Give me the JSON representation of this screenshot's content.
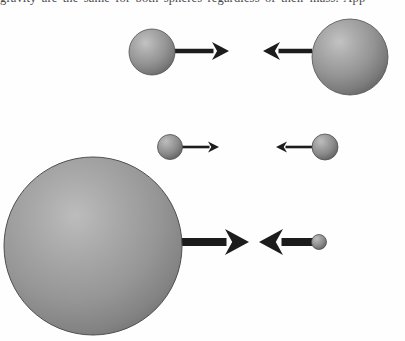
{
  "figure": {
    "caption_fragment_top": "gravity are the same for both spheres regardless of their mass. App",
    "background_color": "#fefefe",
    "sphere_fill_light": "#b4b4b4",
    "sphere_fill_mid": "#8d8d8d",
    "sphere_fill_dark": "#5f5f5f",
    "sphere_edge_color": "#4f4f4f",
    "arrow_color": "#1c1c1c",
    "width": 405,
    "height": 341
  },
  "rows": [
    {
      "name": "row-1",
      "label": "top pair: medium sphere and large sphere",
      "spheres": [
        {
          "name": "row1-left-sphere",
          "cx": 152,
          "cy": 52,
          "r": 23,
          "size_label": "medium"
        },
        {
          "name": "row1-right-sphere",
          "cx": 350,
          "cy": 57,
          "r": 38,
          "size_label": "large"
        }
      ],
      "arrows": [
        {
          "name": "row1-right-arrow",
          "direction": "right",
          "x_start": 175,
          "x_end": 229,
          "y": 51,
          "shaft_width": 4.5,
          "head_length": 17,
          "head_half_height": 9
        },
        {
          "name": "row1-left-arrow",
          "direction": "left",
          "x_start": 312,
          "x_end": 263,
          "y": 51,
          "shaft_width": 4.5,
          "head_length": 17,
          "head_half_height": 9
        }
      ]
    },
    {
      "name": "row-2",
      "label": "middle pair: two small equal spheres",
      "spheres": [
        {
          "name": "row2-left-sphere",
          "cx": 170,
          "cy": 147,
          "r": 12.5,
          "size_label": "small"
        },
        {
          "name": "row2-right-sphere",
          "cx": 325,
          "cy": 147,
          "r": 13,
          "size_label": "small"
        }
      ],
      "arrows": [
        {
          "name": "row2-right-arrow",
          "direction": "right",
          "x_start": 181,
          "x_end": 219,
          "y": 147,
          "shaft_width": 2.6,
          "head_length": 11,
          "head_half_height": 5.5
        },
        {
          "name": "row2-left-arrow",
          "direction": "left",
          "x_start": 314,
          "x_end": 276,
          "y": 147,
          "shaft_width": 2.6,
          "head_length": 11,
          "head_half_height": 5.5
        }
      ]
    },
    {
      "name": "row-3",
      "label": "bottom pair: very large sphere and tiny sphere",
      "spheres": [
        {
          "name": "row3-left-sphere",
          "cx": 93,
          "cy": 246,
          "r": 89,
          "size_label": "very-large"
        },
        {
          "name": "row3-right-sphere",
          "cx": 319,
          "cy": 242,
          "r": 7.5,
          "size_label": "tiny"
        }
      ],
      "arrows": [
        {
          "name": "row3-right-arrow",
          "direction": "right",
          "x_start": 178,
          "x_end": 249,
          "y": 242,
          "shaft_width": 8,
          "head_length": 24,
          "head_half_height": 13
        },
        {
          "name": "row3-left-arrow",
          "direction": "left",
          "x_start": 313,
          "x_end": 259,
          "y": 242,
          "shaft_width": 8,
          "head_length": 24,
          "head_half_height": 13
        }
      ]
    }
  ]
}
